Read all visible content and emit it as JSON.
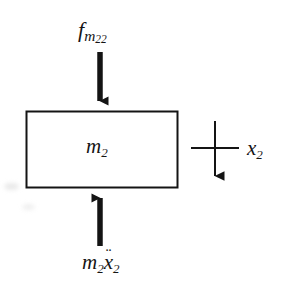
{
  "figure": {
    "type": "free-body-diagram",
    "background_color": "#ffffff",
    "stroke_color": "#141414",
    "body": {
      "shape": "rectangle",
      "label": "m",
      "label_sub": "2",
      "x": 26,
      "y": 111,
      "width": 152,
      "height": 77,
      "stroke_width": 2
    },
    "forces": [
      {
        "name": "applied-force-top",
        "symbol": "f",
        "subscript": "m",
        "sub_subscript": "22",
        "direction": "down",
        "x": 100,
        "y_start": 52,
        "y_end": 110
      },
      {
        "name": "inertial-force-bottom",
        "symbol": "m",
        "subscript": "2",
        "symbol2": "x",
        "accent": "double-dot",
        "subscript2": "2",
        "direction": "up",
        "x": 100,
        "y_start": 246,
        "y_end": 189
      }
    ],
    "coordinate": {
      "name": "displacement-coordinate",
      "label": "x",
      "label_sub": "2",
      "direction": "down",
      "axis_x": 215,
      "axis_y_start": 121,
      "axis_y_end": 186,
      "tick_y": 148,
      "tick_x_start": 191,
      "tick_x_end": 239
    }
  },
  "labels": {
    "force_top": {
      "symbol": "f",
      "sub": "m",
      "sub_sub": "22"
    },
    "mass": {
      "symbol": "m",
      "sub": "2"
    },
    "force_bottom": {
      "m": "m",
      "m_sub": "2",
      "x": "x",
      "ddot": "¨",
      "x_sub": "2"
    },
    "coordinate": {
      "symbol": "x",
      "sub": "2"
    }
  }
}
